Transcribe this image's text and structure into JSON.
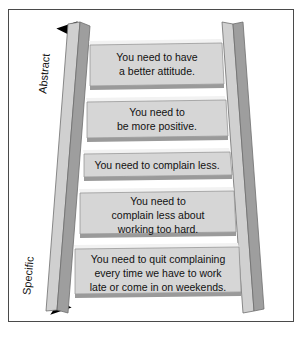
{
  "figure": {
    "background_color": "#ffffff",
    "frame_border_color": "#4a4a4a"
  },
  "axis": {
    "name": "abstraction-axis",
    "top_label": "Abstract",
    "bottom_label": "Specific",
    "arrow_color": "#000000",
    "direction": "double-headed"
  },
  "ladder": {
    "rail_face_color": "#9e9e9e",
    "rail_top_color": "#d0d0d0",
    "rung_face_color": "#d6d6d6",
    "rung_edge_color": "#f2f2f2",
    "rung_shadow_color": "#8f8f8f",
    "rung_count": 5,
    "rungs": [
      {
        "id": "rung-1",
        "level": "most-abstract",
        "lines": [
          "You need to have",
          "a better attitude."
        ]
      },
      {
        "id": "rung-2",
        "level": "abstract",
        "lines": [
          "You need to",
          "be more positive."
        ]
      },
      {
        "id": "rung-3",
        "level": "middle",
        "lines": [
          "You need to complain less."
        ]
      },
      {
        "id": "rung-4",
        "level": "specific",
        "lines": [
          "You need to",
          "complain less about",
          "working too hard."
        ]
      },
      {
        "id": "rung-5",
        "level": "most-specific",
        "lines": [
          "You need to quit complaining",
          "every time we have to work",
          "late or come in on weekends."
        ]
      }
    ]
  }
}
